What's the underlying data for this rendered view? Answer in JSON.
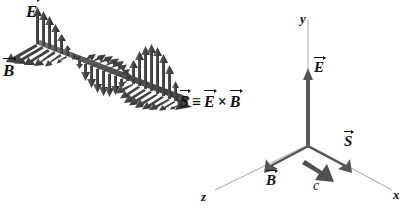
{
  "figure": {
    "background_color": "#ffffff",
    "ink_color": "#111111",
    "wave_color": "#4a4a4a",
    "axis_color": "#b3b3b3",
    "vector_color": "#555555"
  },
  "wave_panel": {
    "e_field_label": "E",
    "b_field_label": "B",
    "poynting_label": "S",
    "equation": {
      "lhs": "S",
      "identity_symbol": "≡",
      "first_factor": "E",
      "cross_symbol": "×",
      "second_factor": "B",
      "full_text": "S ≡ E × B"
    }
  },
  "axes_panel": {
    "y_axis_label": "y",
    "x_axis_label": "x",
    "z_axis_label": "z",
    "e_vector_label": "E",
    "s_vector_label": "S",
    "b_vector_label": "B",
    "speed_label": "c"
  }
}
